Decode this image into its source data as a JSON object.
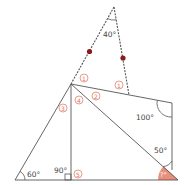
{
  "diagram": {
    "type": "geometry-angle-problem",
    "colors": {
      "line": "#555555",
      "marker": "#e0735a",
      "dot": "#8b1a1a",
      "highlight": "#e8846c"
    },
    "angles": {
      "apex": "40°",
      "bottom_left": "60°",
      "right_angle": "90°",
      "quad_corner": "100°",
      "right_lower": "50°",
      "unknown": "?°"
    },
    "markers": {
      "m1a": "1",
      "m1b": "1",
      "m2": "2",
      "m3": "3",
      "m4": "4",
      "m5": "5"
    }
  }
}
